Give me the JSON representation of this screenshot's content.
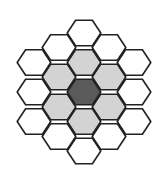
{
  "diagram": {
    "type": "hexagonal-grid",
    "orientation": "flat-top",
    "hex_radius": 16.8,
    "stroke_color": "#222222",
    "stroke_width": 1.6,
    "colors": {
      "center": "#5a5a5a",
      "ring1": "#d3d3d3",
      "ring2": "#ffffff"
    },
    "cells": [
      {
        "cx": 84,
        "cy": 92,
        "ring": "center"
      },
      {
        "cx": 84,
        "cy": 62.5,
        "ring": "ring1"
      },
      {
        "cx": 109,
        "cy": 77,
        "ring": "ring1"
      },
      {
        "cx": 109,
        "cy": 107,
        "ring": "ring1"
      },
      {
        "cx": 84,
        "cy": 121.5,
        "ring": "ring1"
      },
      {
        "cx": 59,
        "cy": 107,
        "ring": "ring1"
      },
      {
        "cx": 59,
        "cy": 77,
        "ring": "ring1"
      },
      {
        "cx": 84,
        "cy": 33,
        "ring": "ring2"
      },
      {
        "cx": 109,
        "cy": 47.5,
        "ring": "ring2"
      },
      {
        "cx": 134,
        "cy": 62.5,
        "ring": "ring2"
      },
      {
        "cx": 134,
        "cy": 92,
        "ring": "ring2"
      },
      {
        "cx": 134,
        "cy": 121.5,
        "ring": "ring2"
      },
      {
        "cx": 109,
        "cy": 136.5,
        "ring": "ring2"
      },
      {
        "cx": 84,
        "cy": 151,
        "ring": "ring2"
      },
      {
        "cx": 59,
        "cy": 136.5,
        "ring": "ring2"
      },
      {
        "cx": 34,
        "cy": 121.5,
        "ring": "ring2"
      },
      {
        "cx": 34,
        "cy": 92,
        "ring": "ring2"
      },
      {
        "cx": 34,
        "cy": 62.5,
        "ring": "ring2"
      },
      {
        "cx": 59,
        "cy": 47.5,
        "ring": "ring2"
      }
    ]
  }
}
